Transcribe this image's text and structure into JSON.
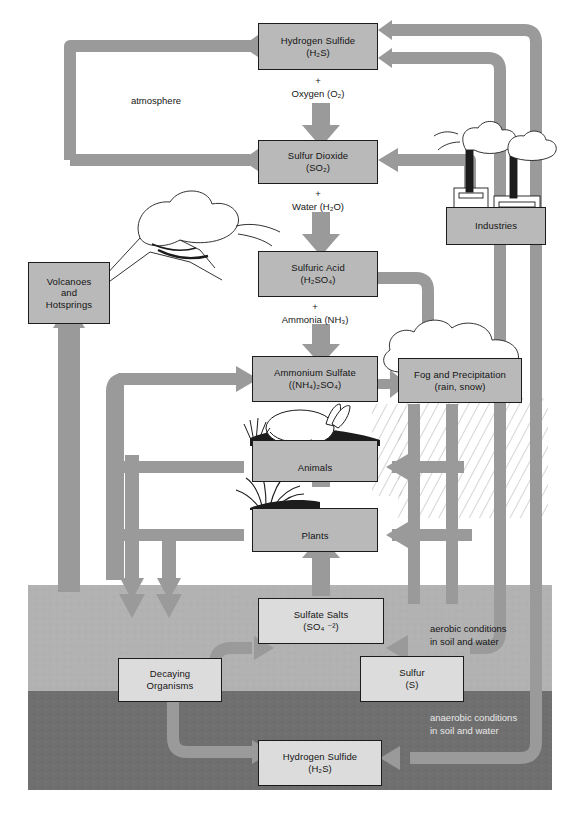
{
  "diagram": {
    "caption": "",
    "colors": {
      "arrow": "#9a9a9a",
      "arrow_dark": "#8a8a8a",
      "box_fill": "#b9b9b9",
      "box_fill_underground": "#dcdcdc",
      "box_stroke": "#1c1c1c",
      "soil_aerobic": "#b0b0b0",
      "soil_anaerobic": "#6e6e6e",
      "background": "#ffffff",
      "text": "#141414"
    }
  },
  "zones": {
    "atmosphere_label": "atmosphere",
    "aerobic_label_line1": "aerobic conditions",
    "aerobic_label_line2": "in soil and water",
    "anaerobic_label_line1": "anaerobic conditions",
    "anaerobic_label_line2": "in soil and water"
  },
  "nodes": [
    {
      "id": "hydrogen-sulfide-air",
      "name": "Hydrogen Sulfide",
      "formula": "(H2S)",
      "line1": "Hydrogen Sulfide",
      "line2": "(H₂S)",
      "region": "atmosphere"
    },
    {
      "id": "sulfur-dioxide",
      "name": "Sulfur Dioxide",
      "formula": "(SO2)",
      "line1": "Sulfur Dioxide",
      "line2": "(SO₂)",
      "region": "atmosphere"
    },
    {
      "id": "sulfuric-acid",
      "name": "Sulfuric Acid",
      "formula": "(H2SO4)",
      "line1": "Sulfuric Acid",
      "line2": "(H₂SO₄)",
      "region": "atmosphere"
    },
    {
      "id": "ammonium-sulfate",
      "name": "Ammonium Sulfate",
      "formula": "((NH4)2SO4)",
      "line1": "Ammonium Sulfate",
      "line2": "((NH₄)₂SO₄)",
      "region": "atmosphere"
    },
    {
      "id": "fog-and-precipitation",
      "name": "Fog and Precipitation",
      "formula": "(rain, snow)",
      "line1": "Fog and Precipitation",
      "line2": "(rain, snow)",
      "region": "atmosphere"
    },
    {
      "id": "volcanoes-and-hotsprings",
      "name": "Volcanoes and Hotsprings",
      "formula": "",
      "line1": "Volcanoes",
      "line2": "and",
      "line3": "Hotsprings",
      "region": "surface"
    },
    {
      "id": "industries",
      "name": "Industries",
      "formula": "",
      "line1": "Industries",
      "region": "surface"
    },
    {
      "id": "animals",
      "name": "Animals",
      "formula": "",
      "line1": "Animals",
      "region": "surface"
    },
    {
      "id": "plants",
      "name": "Plants",
      "formula": "",
      "line1": "Plants",
      "region": "surface"
    },
    {
      "id": "sulfate-salts",
      "name": "Sulfate Salts",
      "formula": "(SO4 -2)",
      "line1": "Sulfate Salts",
      "line2": "(SO₄ ⁻²)",
      "region": "aerobic-soil"
    },
    {
      "id": "decaying-organisms",
      "name": "Decaying Organisms",
      "formula": "",
      "line1": "Decaying",
      "line2": "Organisms",
      "region": "aerobic-soil"
    },
    {
      "id": "sulfur",
      "name": "Sulfur",
      "formula": "(S)",
      "line1": "Sulfur",
      "line2": "(S)",
      "region": "aerobic-soil"
    },
    {
      "id": "hydrogen-sulfide-soil",
      "name": "Hydrogen Sulfide",
      "formula": "(H2S)",
      "line1": "Hydrogen Sulfide",
      "line2": "(H₂S)",
      "region": "anaerobic-soil"
    }
  ],
  "reactions": [
    {
      "id": "oxidation-to-so2",
      "plus": "+",
      "reagent_line": "Oxygen (O₂)",
      "reagent_text": "Oxygen (O2)",
      "from": "hydrogen-sulfide-air",
      "to": "sulfur-dioxide"
    },
    {
      "id": "hydration-to-h2so4",
      "plus": "+",
      "reagent_line": "Water (H₂O)",
      "reagent_text": "Water (H2O)",
      "from": "sulfur-dioxide",
      "to": "sulfuric-acid"
    },
    {
      "id": "neutralization-to-nh4so4",
      "plus": "+",
      "reagent_line": "Ammonia (NH₃)",
      "reagent_text": "Ammonia (NH3)",
      "from": "sulfuric-acid",
      "to": "ammonium-sulfate"
    }
  ],
  "illustrations": [
    {
      "id": "volcano-illustration",
      "label": "erupting volcano with ash plume"
    },
    {
      "id": "factory-illustration",
      "label": "two smokestacks emitting smoke"
    },
    {
      "id": "rabbit-illustration",
      "label": "rabbit on grassy ground"
    },
    {
      "id": "grass-illustration",
      "label": "tuft of grass"
    },
    {
      "id": "cloud-illustration",
      "label": "cloud with rain hatching"
    }
  ]
}
